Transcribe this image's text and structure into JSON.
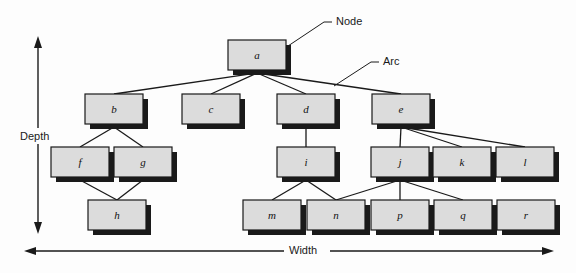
{
  "figure": {
    "type": "tree-diagram",
    "background_color": "#fdfdfd",
    "node_fill": "#dcdcdc",
    "node_stroke": "#1a1a1a",
    "node_shadow": "#1a1a1a",
    "arc_color": "#1a1a1a"
  },
  "annotations": {
    "node_label": "Node",
    "arc_label": "Arc"
  },
  "axes": {
    "depth_label": "Depth",
    "width_label": "Width"
  },
  "chart_data": {
    "type": "diagram",
    "title": "",
    "nodes": [
      {
        "id": "a",
        "label": "a",
        "depth": 0,
        "x": 228,
        "y": 40,
        "w": 58,
        "h": 30
      },
      {
        "id": "b",
        "label": "b",
        "depth": 1,
        "x": 85,
        "y": 94,
        "w": 58,
        "h": 30
      },
      {
        "id": "c",
        "label": "c",
        "depth": 1,
        "x": 182,
        "y": 94,
        "w": 58,
        "h": 30
      },
      {
        "id": "d",
        "label": "d",
        "depth": 1,
        "x": 277,
        "y": 94,
        "w": 58,
        "h": 30
      },
      {
        "id": "e",
        "label": "e",
        "depth": 1,
        "x": 372,
        "y": 94,
        "w": 58,
        "h": 30
      },
      {
        "id": "f",
        "label": "f",
        "depth": 2,
        "x": 51,
        "y": 147,
        "w": 58,
        "h": 30
      },
      {
        "id": "g",
        "label": "g",
        "depth": 2,
        "x": 114,
        "y": 147,
        "w": 58,
        "h": 30
      },
      {
        "id": "i",
        "label": "i",
        "depth": 2,
        "x": 277,
        "y": 147,
        "w": 58,
        "h": 30
      },
      {
        "id": "j",
        "label": "j",
        "depth": 2,
        "x": 371,
        "y": 147,
        "w": 58,
        "h": 30
      },
      {
        "id": "k",
        "label": "k",
        "depth": 2,
        "x": 433,
        "y": 147,
        "w": 58,
        "h": 30
      },
      {
        "id": "l",
        "label": "l",
        "depth": 2,
        "x": 496,
        "y": 147,
        "w": 58,
        "h": 30
      },
      {
        "id": "h",
        "label": "h",
        "depth": 3,
        "x": 88,
        "y": 200,
        "w": 58,
        "h": 30
      },
      {
        "id": "m",
        "label": "m",
        "depth": 3,
        "x": 243,
        "y": 200,
        "w": 58,
        "h": 30
      },
      {
        "id": "n",
        "label": "n",
        "depth": 3,
        "x": 307,
        "y": 200,
        "w": 58,
        "h": 30
      },
      {
        "id": "p",
        "label": "p",
        "depth": 3,
        "x": 371,
        "y": 200,
        "w": 58,
        "h": 30
      },
      {
        "id": "q",
        "label": "q",
        "depth": 3,
        "x": 434,
        "y": 200,
        "w": 58,
        "h": 30
      },
      {
        "id": "r",
        "label": "r",
        "depth": 3,
        "x": 497,
        "y": 200,
        "w": 58,
        "h": 30
      }
    ],
    "arcs": [
      {
        "from": "a",
        "to": "b"
      },
      {
        "from": "a",
        "to": "c"
      },
      {
        "from": "a",
        "to": "d"
      },
      {
        "from": "a",
        "to": "e"
      },
      {
        "from": "b",
        "to": "f"
      },
      {
        "from": "b",
        "to": "g"
      },
      {
        "from": "f",
        "to": "h"
      },
      {
        "from": "g",
        "to": "h"
      },
      {
        "from": "d",
        "to": "i"
      },
      {
        "from": "e",
        "to": "j"
      },
      {
        "from": "e",
        "to": "k"
      },
      {
        "from": "e",
        "to": "l"
      },
      {
        "from": "i",
        "to": "m"
      },
      {
        "from": "i",
        "to": "n"
      },
      {
        "from": "j",
        "to": "n"
      },
      {
        "from": "j",
        "to": "p"
      },
      {
        "from": "j",
        "to": "q"
      }
    ]
  }
}
